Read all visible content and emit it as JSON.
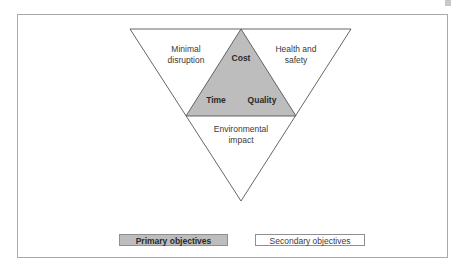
{
  "diagram": {
    "type": "inverted-triangle",
    "primary_objectives": {
      "top": "Cost",
      "bottom_left": "Time",
      "bottom_right": "Quality"
    },
    "secondary_objectives": {
      "left": [
        "Minimal",
        "disruption"
      ],
      "right": [
        "Health and",
        "safety"
      ],
      "bottom": [
        "Environmental",
        "impact"
      ]
    },
    "colors": {
      "primary_fill": "#bdbdbd",
      "secondary_fill": "#ffffff",
      "stroke": "#555555",
      "frame": "#a9a9a9"
    }
  },
  "legend": {
    "primary_label": "Primary objectives",
    "secondary_label": "Secondary objectives"
  }
}
